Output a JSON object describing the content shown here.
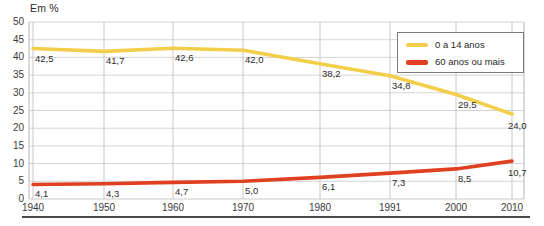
{
  "chart_data": {
    "type": "line",
    "title": "Em %",
    "xlabel": "",
    "ylabel": "Em %",
    "x": [
      1940,
      1950,
      1960,
      1970,
      1980,
      1991,
      2000,
      2010
    ],
    "categories": [
      "1940",
      "1950",
      "1960",
      "1970",
      "1980",
      "1991",
      "2000",
      "2010"
    ],
    "series": [
      {
        "name": "0 a 14 anos",
        "color": "#f2ce4b",
        "values": [
          42.5,
          41.7,
          42.6,
          42.0,
          38.2,
          34.8,
          29.5,
          24.0
        ],
        "labels": [
          "42,5",
          "41,7",
          "42,6",
          "42,0",
          "38,2",
          "34,8",
          "29,5",
          "24,0"
        ]
      },
      {
        "name": "60 anos ou mais",
        "color": "#e0401f",
        "values": [
          4.1,
          4.3,
          4.7,
          5.0,
          6.1,
          7.3,
          8.5,
          10.7
        ],
        "labels": [
          "4,1",
          "4,3",
          "4,7",
          "5,0",
          "6,1",
          "7,3",
          "8,5",
          "10,7"
        ]
      }
    ],
    "ylim": [
      0,
      50
    ],
    "yticks": [
      0,
      5,
      10,
      15,
      20,
      25,
      30,
      35,
      40,
      45,
      50
    ],
    "ytick_labels": [
      "0",
      "5",
      "10",
      "15",
      "20",
      "25",
      "30",
      "35",
      "40",
      "45",
      "50"
    ],
    "grid": true,
    "legend_position": "top-right"
  },
  "legend": {
    "items": [
      {
        "label": "0 a 14 anos",
        "color": "#f2ce4b"
      },
      {
        "label": "60 anos ou mais",
        "color": "#e0401f"
      }
    ]
  },
  "axis": {
    "unit_title": "Em %"
  }
}
